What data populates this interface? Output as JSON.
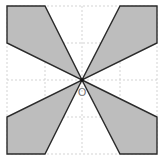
{
  "figure": {
    "origin_label": "O",
    "colors": {
      "fill": "#bdbdbd",
      "stroke": "#2b2b2b",
      "grid": "#c8c8c8",
      "label": "#777777"
    },
    "grid": {
      "x_lines": [
        7,
        45,
        82,
        120,
        157
      ],
      "y_lines": [
        6,
        43,
        80,
        117,
        154
      ]
    },
    "center": [
      82,
      80
    ],
    "shapes": [
      {
        "name": "top-left-petal",
        "points": [
          [
            7,
            6
          ],
          [
            45,
            6
          ],
          [
            82,
            80
          ],
          [
            7,
            43
          ]
        ]
      },
      {
        "name": "top-right-petal",
        "points": [
          [
            120,
            6
          ],
          [
            157,
            6
          ],
          [
            157,
            43
          ],
          [
            82,
            80
          ]
        ]
      },
      {
        "name": "bottom-left-petal",
        "points": [
          [
            82,
            80
          ],
          [
            45,
            154
          ],
          [
            7,
            154
          ],
          [
            7,
            117
          ]
        ]
      },
      {
        "name": "bottom-right-petal",
        "points": [
          [
            82,
            80
          ],
          [
            157,
            117
          ],
          [
            157,
            154
          ],
          [
            120,
            154
          ]
        ]
      }
    ]
  }
}
